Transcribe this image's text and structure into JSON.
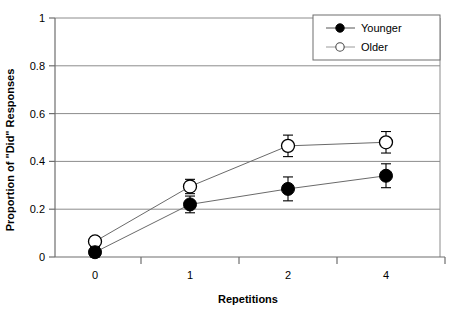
{
  "chart_data": {
    "type": "line",
    "title": "",
    "xlabel": "Repetitions",
    "ylabel": "Proportion of \"Did\" Responses",
    "categories": [
      "0",
      "1",
      "2",
      "4"
    ],
    "x": [
      0,
      1,
      2,
      4
    ],
    "ylim": [
      0,
      1
    ],
    "yticks": [
      "0",
      "0.2",
      "0.4",
      "0.6",
      "0.8",
      "1"
    ],
    "ytick_values": [
      0,
      0.2,
      0.4,
      0.6,
      0.8,
      1
    ],
    "grid": "horizontal",
    "legend_position": "top-right",
    "series": [
      {
        "name": "Younger",
        "marker": "filled-circle",
        "values": [
          0.02,
          0.22,
          0.285,
          0.34
        ],
        "errors": [
          0.02,
          0.035,
          0.05,
          0.05
        ]
      },
      {
        "name": "Older",
        "marker": "open-circle",
        "values": [
          0.065,
          0.295,
          0.465,
          0.48
        ],
        "errors": [
          0.02,
          0.03,
          0.045,
          0.045
        ]
      }
    ],
    "colors": {
      "line": "#555555",
      "marker_fill": "#000000",
      "marker_open_fill": "#ffffff",
      "grid": "#808080",
      "axis": "#808080"
    }
  },
  "legend": {
    "items": [
      {
        "label": "Younger",
        "marker": "filled-circle"
      },
      {
        "label": "Older",
        "marker": "open-circle"
      }
    ]
  },
  "axes": {
    "y_title": "Proportion of \"Did\" Responses",
    "x_title": "Repetitions"
  }
}
